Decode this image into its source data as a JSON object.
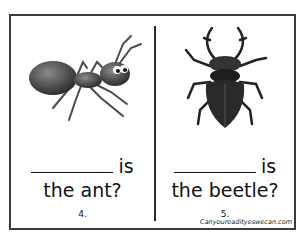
{
  "pages": [
    {
      "id": "ant",
      "image": "ant-illustration",
      "blank_suffix": "is",
      "question": "the ant?",
      "page_number": "4."
    },
    {
      "id": "beetle",
      "image": "stag-beetle-illustration",
      "blank_suffix": "is",
      "question": "the beetle?",
      "page_number": "5."
    }
  ],
  "watermark": "Canyoureadityeswecan.com",
  "colors": {
    "border": "#3a3a3a",
    "text": "#111111",
    "background": "#ffffff"
  }
}
